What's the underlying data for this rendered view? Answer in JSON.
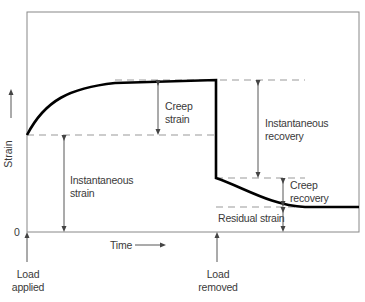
{
  "diagram": {
    "type": "creep-strain-time-curve",
    "axes": {
      "y_label": "Strain",
      "x_label": "Time",
      "origin_label": "0"
    },
    "events": {
      "load_applied": "Load\napplied",
      "load_applied_line1": "Load",
      "load_applied_line2": "applied",
      "load_removed_line1": "Load",
      "load_removed_line2": "removed"
    },
    "annotations": {
      "creep_strain_line1": "Creep",
      "creep_strain_line2": "strain",
      "instantaneous_strain_line1": "Instantaneous",
      "instantaneous_strain_line2": "strain",
      "instantaneous_recovery_line1": "Instantaneous",
      "instantaneous_recovery_line2": "recovery",
      "creep_recovery_line1": "Creep",
      "creep_recovery_line2": "recovery",
      "residual_strain": "Residual strain"
    },
    "colors": {
      "curve": "#000000",
      "frame": "#888888",
      "dashed": "#999999",
      "arrow": "#444444",
      "text": "#3a3a3a"
    }
  }
}
